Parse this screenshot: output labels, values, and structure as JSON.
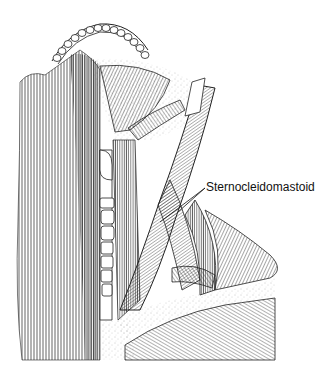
{
  "figure": {
    "type": "anatomical-illustration",
    "style": "pen-and-ink line drawing",
    "labels": [
      {
        "text": "Sternocleidomastoid",
        "position": {
          "x": 206,
          "y": 180
        },
        "leader_lines": 2
      }
    ]
  },
  "colors": {
    "ink": "#111111",
    "paper": "#ffffff",
    "stipple": "#9a9a9a"
  }
}
